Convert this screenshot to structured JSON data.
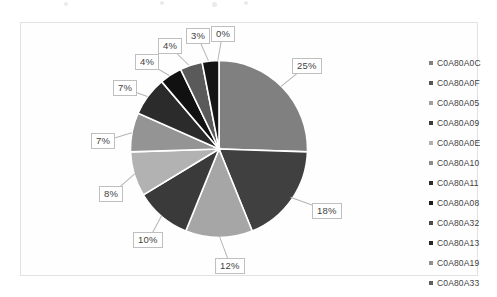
{
  "chart_data": {
    "type": "pie",
    "title": "",
    "legend_position": "right",
    "grid": false,
    "value_suffix": "%",
    "categories": [
      "C0A80A0C",
      "C0A80A0F",
      "C0A80A05",
      "C0A80A09",
      "C0A80A0E",
      "C0A80A10",
      "C0A80A11",
      "C0A80A08",
      "C0A80A32",
      "C0A80A13",
      "C0A80A19",
      "C0A80A33"
    ],
    "values": [
      25,
      18,
      12,
      10,
      8,
      7,
      7,
      4,
      4,
      3,
      0,
      0
    ],
    "labels": [
      "25%",
      "18%",
      "12%",
      "10%",
      "8%",
      "7%",
      "7%",
      "4%",
      "4%",
      "3%",
      "0%",
      "0%"
    ],
    "colors": [
      "#808080",
      "#404040",
      "#a6a6a6",
      "#3a3a3a",
      "#b2b2b2",
      "#949494",
      "#2b2b2b",
      "#111111",
      "#5a5a5a",
      "#151515",
      "#9a9a9a",
      "#6e6e6e"
    ]
  },
  "legend": {
    "items": [
      {
        "label": "C0A80A0C",
        "color": "#808080"
      },
      {
        "label": "C0A80A0F",
        "color": "#555555"
      },
      {
        "label": "C0A80A05",
        "color": "#9e9e9e"
      },
      {
        "label": "C0A80A09",
        "color": "#3a3a3a"
      },
      {
        "label": "C0A80A0E",
        "color": "#b0b0b0"
      },
      {
        "label": "C0A80A10",
        "color": "#8a8a8a"
      },
      {
        "label": "C0A80A11",
        "color": "#2b2b2b"
      },
      {
        "label": "C0A80A08",
        "color": "#1a1a1a"
      },
      {
        "label": "C0A80A32",
        "color": "#4a4a4a"
      },
      {
        "label": "C0A80A13",
        "color": "#252525"
      },
      {
        "label": "C0A80A19",
        "color": "#8f8f8f"
      },
      {
        "label": "C0A80A33",
        "color": "#5f5f5f"
      }
    ]
  },
  "data_labels": [
    {
      "text": "25%",
      "x": 292,
      "y": 58
    },
    {
      "text": "18%",
      "x": 312,
      "y": 203
    },
    {
      "text": "12%",
      "x": 215,
      "y": 258
    },
    {
      "text": "10%",
      "x": 133,
      "y": 232
    },
    {
      "text": "8%",
      "x": 99,
      "y": 186
    },
    {
      "text": "7%",
      "x": 91,
      "y": 133
    },
    {
      "text": "7%",
      "x": 113,
      "y": 80
    },
    {
      "text": "4%",
      "x": 135,
      "y": 54
    },
    {
      "text": "4%",
      "x": 158,
      "y": 38
    },
    {
      "text": "3%",
      "x": 186,
      "y": 28
    },
    {
      "text": "0%",
      "x": 211,
      "y": 26
    }
  ]
}
